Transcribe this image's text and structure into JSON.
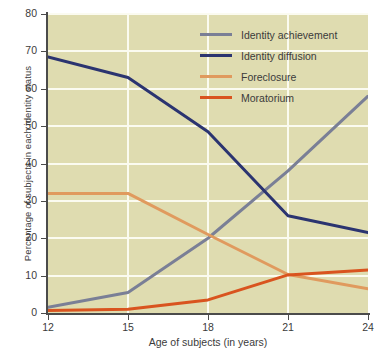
{
  "chart_data": {
    "type": "line",
    "title": "",
    "xlabel": "Age of subjects (in years)",
    "ylabel": "Percentage of subjects in each identity status",
    "x": [
      12,
      15,
      18,
      21,
      24
    ],
    "xticks": [
      "12",
      "15",
      "18",
      "21",
      "24"
    ],
    "yticks": [
      "0",
      "10",
      "20",
      "30",
      "40",
      "50",
      "60",
      "70",
      "80"
    ],
    "xlim": [
      12,
      24
    ],
    "ylim": [
      0,
      80
    ],
    "grid": "both",
    "legend_position": "top-right",
    "plot_background": "#dfdcb0",
    "gridline_color": "#fbfbf0",
    "series": [
      {
        "name": "Identity achievement",
        "color": "#7a7f96",
        "values": [
          1.5,
          5.5,
          20.0,
          38.0,
          58.0
        ]
      },
      {
        "name": "Identity diffusion",
        "color": "#2b3470",
        "values": [
          68.5,
          63.0,
          48.5,
          26.0,
          21.5
        ]
      },
      {
        "name": "Foreclosure",
        "color": "#e09a5e",
        "values": [
          32.0,
          32.0,
          21.0,
          10.3,
          6.5
        ]
      },
      {
        "name": "Moratorium",
        "color": "#d9541f",
        "values": [
          0.7,
          1.0,
          3.5,
          10.2,
          11.5
        ]
      }
    ]
  }
}
